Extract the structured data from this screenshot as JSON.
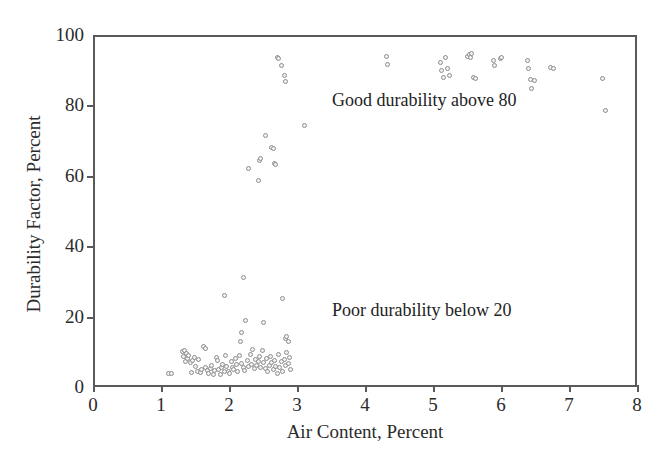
{
  "chart_data": {
    "type": "scatter",
    "title": "",
    "xlabel": "Air Content, Percent",
    "ylabel": "Durability Factor, Percent",
    "xlim": [
      0,
      8
    ],
    "ylim": [
      0,
      100
    ],
    "xticks": [
      0,
      1,
      2,
      3,
      4,
      5,
      6,
      7,
      8
    ],
    "yticks": [
      0,
      20,
      40,
      60,
      80,
      100
    ],
    "grid": false,
    "legend": null,
    "marker": {
      "shape": "open-circle",
      "edge_color": "#8d8d8d",
      "fill_color": "#f2f2f2",
      "size_px": 5
    },
    "annotations": [
      {
        "text": "Good durability above 80",
        "x": 4.5,
        "y": 84
      },
      {
        "text": "Poor durability below 20",
        "x": 4.5,
        "y": 24
      }
    ],
    "series": [
      {
        "name": "Concrete specimens",
        "points": [
          [
            1.08,
            4.4
          ],
          [
            1.13,
            4.3
          ],
          [
            1.28,
            10.6
          ],
          [
            1.3,
            9.2
          ],
          [
            1.31,
            11.0
          ],
          [
            1.33,
            7.9
          ],
          [
            1.35,
            10.2
          ],
          [
            1.36,
            8.6
          ],
          [
            1.38,
            9.6
          ],
          [
            1.4,
            7.4
          ],
          [
            1.42,
            4.6
          ],
          [
            1.44,
            8.1
          ],
          [
            1.46,
            9.0
          ],
          [
            1.48,
            6.3
          ],
          [
            1.5,
            5.0
          ],
          [
            1.52,
            8.4
          ],
          [
            1.55,
            4.8
          ],
          [
            1.57,
            5.5
          ],
          [
            1.6,
            12.0
          ],
          [
            1.62,
            11.4
          ],
          [
            1.63,
            6.0
          ],
          [
            1.65,
            5.2
          ],
          [
            1.67,
            4.4
          ],
          [
            1.7,
            5.8
          ],
          [
            1.72,
            6.6
          ],
          [
            1.74,
            4.1
          ],
          [
            1.76,
            5.3
          ],
          [
            1.78,
            9.0
          ],
          [
            1.8,
            8.2
          ],
          [
            1.82,
            5.6
          ],
          [
            1.84,
            4.2
          ],
          [
            1.86,
            6.1
          ],
          [
            1.88,
            7.0
          ],
          [
            1.9,
            5.0
          ],
          [
            1.9,
            26.6
          ],
          [
            1.92,
            9.6
          ],
          [
            1.94,
            6.4
          ],
          [
            1.96,
            5.1
          ],
          [
            1.98,
            4.3
          ],
          [
            2.0,
            7.7
          ],
          [
            2.02,
            6.0
          ],
          [
            2.04,
            5.4
          ],
          [
            2.06,
            8.8
          ],
          [
            2.08,
            6.9
          ],
          [
            2.1,
            5.0
          ],
          [
            2.12,
            9.4
          ],
          [
            2.14,
            13.4
          ],
          [
            2.15,
            7.2
          ],
          [
            2.16,
            16.0
          ],
          [
            2.18,
            6.1
          ],
          [
            2.18,
            31.8
          ],
          [
            2.2,
            5.3
          ],
          [
            2.22,
            19.6
          ],
          [
            2.24,
            8.0
          ],
          [
            2.25,
            62.7
          ],
          [
            2.26,
            6.5
          ],
          [
            2.28,
            9.9
          ],
          [
            2.3,
            7.1
          ],
          [
            2.32,
            11.2
          ],
          [
            2.34,
            5.9
          ],
          [
            2.36,
            8.3
          ],
          [
            2.38,
            6.7
          ],
          [
            2.4,
            59.3
          ],
          [
            2.4,
            7.8
          ],
          [
            2.42,
            64.8
          ],
          [
            2.42,
            9.1
          ],
          [
            2.44,
            65.4
          ],
          [
            2.44,
            6.2
          ],
          [
            2.46,
            10.8
          ],
          [
            2.48,
            19.0
          ],
          [
            2.48,
            7.4
          ],
          [
            2.5,
            5.7
          ],
          [
            2.5,
            71.9
          ],
          [
            2.52,
            8.6
          ],
          [
            2.54,
            4.9
          ],
          [
            2.56,
            6.8
          ],
          [
            2.58,
            9.3
          ],
          [
            2.6,
            68.6
          ],
          [
            2.6,
            7.5
          ],
          [
            2.62,
            68.2
          ],
          [
            2.62,
            5.4
          ],
          [
            2.64,
            64.2
          ],
          [
            2.64,
            8.1
          ],
          [
            2.66,
            63.9
          ],
          [
            2.66,
            6.3
          ],
          [
            2.68,
            94.2
          ],
          [
            2.68,
            4.5
          ],
          [
            2.7,
            94.0
          ],
          [
            2.7,
            9.7
          ],
          [
            2.72,
            6.0
          ],
          [
            2.74,
            91.8
          ],
          [
            2.74,
            7.9
          ],
          [
            2.76,
            25.7
          ],
          [
            2.76,
            5.1
          ],
          [
            2.78,
            89.2
          ],
          [
            2.78,
            8.4
          ],
          [
            2.8,
            87.3
          ],
          [
            2.8,
            6.6
          ],
          [
            2.8,
            14.4
          ],
          [
            2.82,
            14.9
          ],
          [
            2.82,
            10.5
          ],
          [
            2.84,
            13.6
          ],
          [
            2.84,
            7.2
          ],
          [
            2.86,
            9.0
          ],
          [
            2.88,
            5.6
          ],
          [
            3.08,
            74.8
          ],
          [
            4.28,
            94.4
          ],
          [
            4.3,
            92.1
          ],
          [
            5.08,
            92.7
          ],
          [
            5.1,
            90.5
          ],
          [
            5.12,
            88.6
          ],
          [
            5.16,
            94.1
          ],
          [
            5.18,
            91.0
          ],
          [
            5.22,
            89.2
          ],
          [
            5.48,
            94.6
          ],
          [
            5.5,
            95.1
          ],
          [
            5.52,
            94.2
          ],
          [
            5.54,
            95.3
          ],
          [
            5.56,
            88.4
          ],
          [
            5.6,
            88.1
          ],
          [
            5.86,
            93.4
          ],
          [
            5.88,
            92.0
          ],
          [
            5.96,
            94.0
          ],
          [
            5.98,
            94.3
          ],
          [
            6.36,
            93.2
          ],
          [
            6.38,
            91.1
          ],
          [
            6.4,
            88.0
          ],
          [
            6.42,
            85.4
          ],
          [
            6.46,
            87.6
          ],
          [
            6.7,
            91.4
          ],
          [
            6.74,
            91.0
          ],
          [
            7.46,
            88.3
          ],
          [
            7.5,
            79.0
          ]
        ]
      }
    ]
  },
  "axes": {
    "x_tick_labels": [
      "0",
      "1",
      "2",
      "3",
      "4",
      "5",
      "6",
      "7",
      "8"
    ],
    "y_tick_labels": [
      "0",
      "20",
      "40",
      "60",
      "80",
      "100"
    ],
    "x_title": "Air Content, Percent",
    "y_title": "Durability Factor, Percent"
  },
  "annotations": {
    "good": "Good durability above 80",
    "poor": "Poor durability below 20"
  },
  "colors": {
    "axis": "#5a5a5a",
    "marker_edge": "#8d8d8d",
    "marker_fill": "#f2f2f2",
    "text": "#222222",
    "background": "#ffffff"
  }
}
